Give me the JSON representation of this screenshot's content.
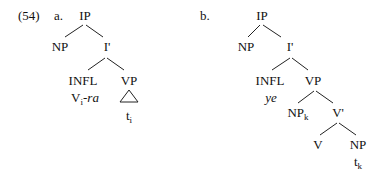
{
  "example": {
    "number": "(54)",
    "colors": {
      "text": "#111111",
      "lines": "#222222",
      "background": "#ffffff"
    }
  },
  "tree_a": {
    "label": "a.",
    "nodes": {
      "ip": "IP",
      "np": "NP",
      "ibar": "I'",
      "infl": "INFL",
      "vp": "VP",
      "infl_content_base": "V",
      "infl_content_sub": "i",
      "infl_content_suffix": "-ra",
      "vp_content_base": "t",
      "vp_content_sub": "i"
    },
    "vp_abbreviation": "triangle"
  },
  "tree_b": {
    "label": "b.",
    "nodes": {
      "ip": "IP",
      "np": "NP",
      "ibar": "I'",
      "infl": "INFL",
      "vp": "VP",
      "infl_content": "ye",
      "np_spec_base": "NP",
      "np_spec_sub": "k",
      "vbar": "V'",
      "v": "V",
      "np_obj": "NP",
      "np_obj_content_base": "t",
      "np_obj_content_sub": "k"
    }
  }
}
